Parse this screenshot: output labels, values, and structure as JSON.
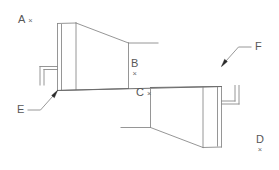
{
  "drawing": {
    "title": "Two-body mirrored assembly line drawing",
    "background_color": "#ffffff",
    "line_color": "#8a8a8a",
    "arrow_color": "#2a2a2a",
    "label_color": "#575757",
    "mark_symbol": "×"
  },
  "labels": {
    "a": {
      "glyph": "A",
      "mark": "×",
      "layout": "stacked-right"
    },
    "b": {
      "glyph": "B",
      "mark": "×",
      "layout": "stacked-below"
    },
    "c": {
      "glyph": "C",
      "mark": "×",
      "layout": "inline-right"
    },
    "d": {
      "glyph": "D",
      "mark": "×",
      "layout": "stacked-below"
    },
    "e": {
      "glyph": "E",
      "mark": "",
      "layout": "leader"
    },
    "f": {
      "glyph": "F",
      "mark": "",
      "layout": "leader"
    }
  }
}
